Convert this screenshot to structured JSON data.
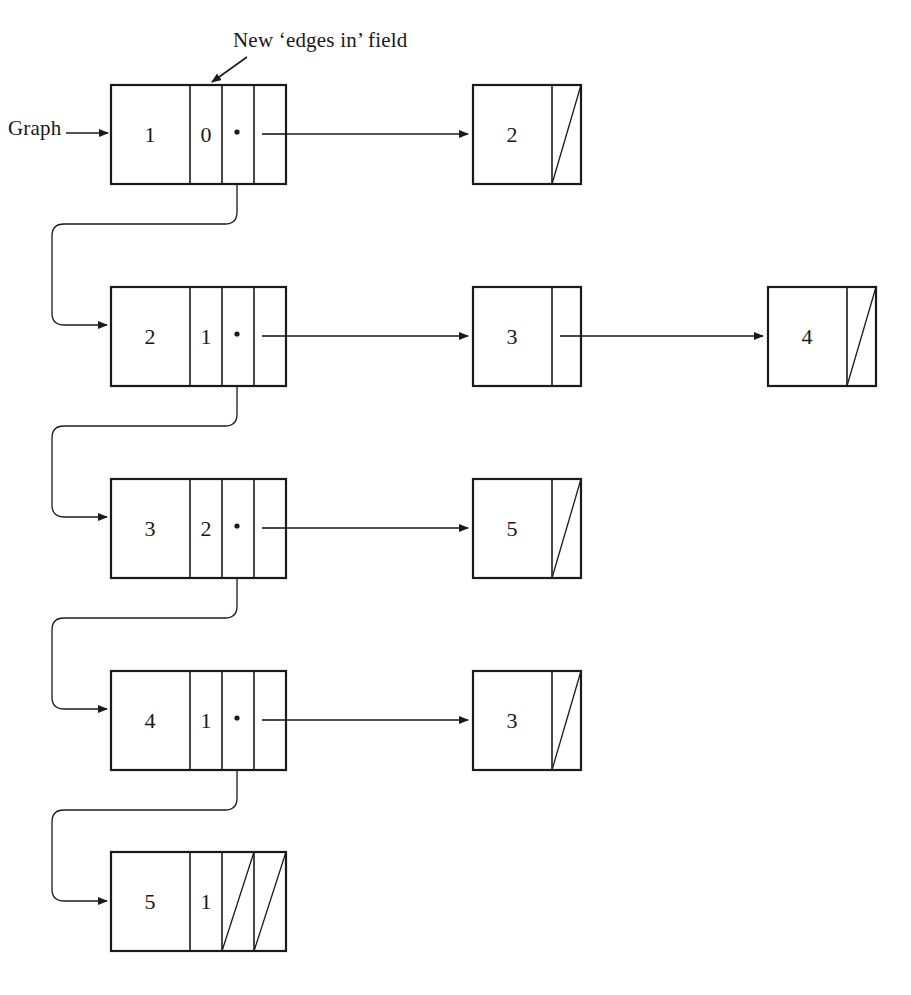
{
  "figure": {
    "type": "linked-list-adjacency-graph-diagram",
    "background": "#ffffff",
    "line_color": "#1a1a1a"
  },
  "annotations": {
    "graph_pointer_label": "Graph",
    "edges_in_label": "New ‘edges in’ field"
  },
  "header_nodes": [
    {
      "vertex": "1",
      "edges_in": "0",
      "has_down_pointer": true,
      "has_right_pointer": true,
      "next_vertex_label": "2"
    },
    {
      "vertex": "2",
      "edges_in": "1",
      "has_down_pointer": true,
      "has_right_pointer": true,
      "next_vertex_label": "3"
    },
    {
      "vertex": "3",
      "edges_in": "2",
      "has_down_pointer": true,
      "has_right_pointer": true,
      "next_vertex_label": "4"
    },
    {
      "vertex": "4",
      "edges_in": "1",
      "has_down_pointer": true,
      "has_right_pointer": true,
      "next_vertex_label": "5"
    },
    {
      "vertex": "5",
      "edges_in": "1",
      "has_down_pointer": false,
      "has_right_pointer": false,
      "next_vertex_label": ""
    }
  ],
  "edge_nodes": [
    {
      "row": 1,
      "value": "2",
      "null_next": true
    },
    {
      "row": 2,
      "value": "3",
      "null_next": false
    },
    {
      "row": 2,
      "value": "4",
      "null_next": true
    },
    {
      "row": 3,
      "value": "5",
      "null_next": true
    },
    {
      "row": 4,
      "value": "3",
      "null_next": true
    }
  ],
  "cell_values": {
    "r1c1": "1",
    "r1c2": "0",
    "r2c1": "2",
    "r2c2": "1",
    "r3c1": "3",
    "r3c2": "2",
    "r4c1": "4",
    "r4c2": "1",
    "r5c1": "5",
    "r5c2": "1",
    "e1": "2",
    "e2": "3",
    "e3": "4",
    "e4": "5",
    "e5": "3"
  }
}
